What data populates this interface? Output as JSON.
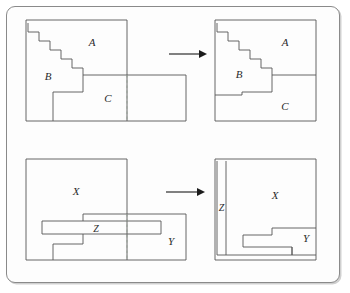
{
  "figure": {
    "background_color": "#ffffff",
    "frame_color": "#8a8a8a",
    "stroke_color": "#555555",
    "label_color": "#2b2b2b",
    "dashed_color": "#9aa39a"
  },
  "rows": [
    {
      "name": "row-top",
      "labels": {
        "before": [
          "A",
          "B",
          "C"
        ],
        "after": [
          "A",
          "B",
          "C"
        ]
      },
      "arrow": "right-arrow"
    },
    {
      "name": "row-bottom",
      "labels": {
        "before": [
          "X",
          "Y",
          "Z"
        ],
        "after": [
          "X",
          "Y",
          "Z"
        ]
      },
      "arrow": "right-arrow"
    }
  ],
  "labels": {
    "top_before_A": "A",
    "top_before_B": "B",
    "top_before_C": "C",
    "top_after_A": "A",
    "top_after_B": "B",
    "top_after_C": "C",
    "bottom_before_X": "X",
    "bottom_before_Y": "Y",
    "bottom_before_Z": "Z",
    "bottom_after_X": "X",
    "bottom_after_Y": "Y",
    "bottom_after_Z": "Z"
  },
  "geometry": {
    "top_before": {
      "outer_big": {
        "x": 0,
        "y": 0,
        "w": 101,
        "h": 101
      },
      "outer_small": {
        "x": 101,
        "y": 55,
        "w": 59,
        "h": 46
      },
      "staircase_steps": 7,
      "dashed_x": 101
    },
    "top_after": {
      "outer": {
        "x": 0,
        "y": 0,
        "w": 101,
        "h": 101
      },
      "staircase_steps": 7
    },
    "bottom_before": {
      "outer_big": {
        "x": 0,
        "y": 0,
        "w": 101,
        "h": 101
      },
      "outer_small": {
        "x": 101,
        "y": 55,
        "w": 59,
        "h": 46
      },
      "z_bar": {
        "x": 16,
        "y": 62,
        "w": 119,
        "h": 13
      },
      "dashed_x": 101
    },
    "bottom_after": {
      "outer": {
        "x": 0,
        "y": 0,
        "w": 101,
        "h": 101
      },
      "z_strip": {
        "x": 0,
        "y": 0,
        "w": 10,
        "h": 101
      }
    }
  }
}
